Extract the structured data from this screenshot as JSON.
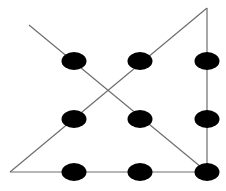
{
  "diagram": {
    "type": "nine-dots-puzzle-solution",
    "colors": {
      "background": "#ffffff",
      "dot": "#000000",
      "line": "#6e6e6e"
    },
    "dots": [
      {
        "row": 0,
        "col": 0,
        "cx": 74,
        "cy": 61,
        "rx": 12.5,
        "ry": 9
      },
      {
        "row": 0,
        "col": 1,
        "cx": 140,
        "cy": 61,
        "rx": 12.5,
        "ry": 9
      },
      {
        "row": 0,
        "col": 2,
        "cx": 207,
        "cy": 61,
        "rx": 12.5,
        "ry": 9
      },
      {
        "row": 1,
        "col": 0,
        "cx": 74,
        "cy": 119,
        "rx": 12.5,
        "ry": 9
      },
      {
        "row": 1,
        "col": 1,
        "cx": 140,
        "cy": 119,
        "rx": 12.5,
        "ry": 9
      },
      {
        "row": 1,
        "col": 2,
        "cx": 207,
        "cy": 119,
        "rx": 12.5,
        "ry": 9
      },
      {
        "row": 2,
        "col": 0,
        "cx": 74,
        "cy": 172,
        "rx": 12.5,
        "ry": 9
      },
      {
        "row": 2,
        "col": 1,
        "cx": 140,
        "cy": 172,
        "rx": 12.5,
        "ry": 9
      },
      {
        "row": 2,
        "col": 2,
        "cx": 207,
        "cy": 172,
        "rx": 12.5,
        "ry": 9
      }
    ],
    "lines": [
      {
        "id": "line-1-diagonal-down",
        "x1": 29,
        "y1": 25,
        "x2": 207,
        "y2": 172
      },
      {
        "id": "line-2-vertical",
        "x1": 207,
        "y1": 172,
        "x2": 207,
        "y2": 8
      },
      {
        "id": "line-3-diagonal-up",
        "x1": 207,
        "y1": 8,
        "x2": 10,
        "y2": 172
      },
      {
        "id": "line-4-horizontal",
        "x1": 10,
        "y1": 172,
        "x2": 207,
        "y2": 172
      }
    ]
  }
}
